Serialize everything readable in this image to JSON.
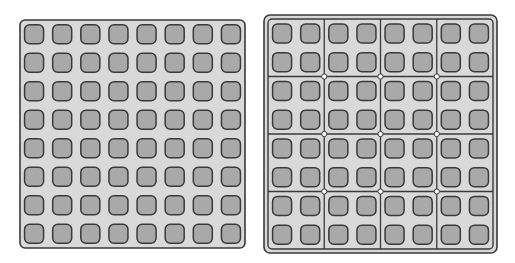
{
  "diagram": {
    "left_grid": {
      "rows": 8,
      "cols": 8,
      "partitioned": false
    },
    "right_grid": {
      "rows": 8,
      "cols": 8,
      "partitioned": true,
      "block_rows": 4,
      "block_cols": 4,
      "block_size": "2x2"
    },
    "colors": {
      "background": "#ffffff",
      "panel_fill": "#d9d9d9",
      "cell_fill": "#a9a9a9",
      "stroke": "#3a3a3a",
      "junction_fill": "#ffffff"
    }
  }
}
